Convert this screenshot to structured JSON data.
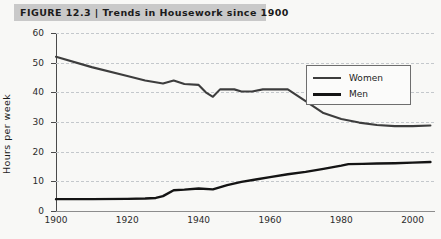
{
  "figure": {
    "label": "FIGURE 12.3",
    "separator": "|",
    "caption": "Trends in Housework since 1900",
    "title_full": "FIGURE 12.3 | Trends in Housework since 1900"
  },
  "legend": {
    "position": "top-right-inside",
    "entries": [
      {
        "label": "Women",
        "color": "#3d3d3d",
        "icon": "line-swatch-icon"
      },
      {
        "label": "Men",
        "color": "#141414",
        "icon": "line-swatch-icon"
      }
    ]
  },
  "axes": {
    "y_title": "Hours per week",
    "x_title": "",
    "y_ticks": [
      "0",
      "10",
      "20",
      "30",
      "40",
      "50",
      "60"
    ],
    "x_ticks": [
      "1900",
      "1920",
      "1940",
      "1960",
      "1980",
      "2000"
    ]
  },
  "chart_data": {
    "type": "line",
    "title": "Trends in Housework since 1900",
    "xlabel": "",
    "ylabel": "Hours per week",
    "xlim": [
      1900,
      2006
    ],
    "ylim": [
      0,
      60
    ],
    "ytick_values": [
      0,
      10,
      20,
      30,
      40,
      50,
      60
    ],
    "xtick_values": [
      1900,
      1920,
      1940,
      1960,
      1980,
      2000
    ],
    "grid": "horizontal-dashed",
    "legend_position": "upper right",
    "series": [
      {
        "name": "Women",
        "color": "#3d3d3d",
        "x": [
          1900,
          1910,
          1920,
          1925,
          1930,
          1933,
          1936,
          1940,
          1942,
          1944,
          1946,
          1950,
          1952,
          1955,
          1958,
          1962,
          1965,
          1970,
          1975,
          1980,
          1985,
          1990,
          1995,
          2000,
          2005
        ],
        "y": [
          52,
          48.5,
          45.5,
          44,
          43,
          44,
          42.8,
          42.5,
          40,
          38.5,
          41,
          41,
          40.3,
          40.3,
          41,
          41,
          41,
          37,
          33,
          31,
          29.8,
          29,
          28.6,
          28.6,
          28.8
        ]
      },
      {
        "name": "Men",
        "color": "#141414",
        "x": [
          1900,
          1910,
          1920,
          1925,
          1928,
          1930,
          1933,
          1936,
          1940,
          1944,
          1948,
          1952,
          1956,
          1960,
          1965,
          1970,
          1975,
          1980,
          1982,
          1986,
          1990,
          1995,
          2000,
          2005
        ],
        "y": [
          4,
          4,
          4.1,
          4.2,
          4.4,
          5,
          7,
          7.2,
          7.6,
          7.3,
          8.7,
          9.8,
          10.6,
          11.4,
          12.4,
          13.2,
          14.2,
          15.3,
          15.8,
          15.9,
          16,
          16.1,
          16.3,
          16.5
        ]
      }
    ]
  }
}
